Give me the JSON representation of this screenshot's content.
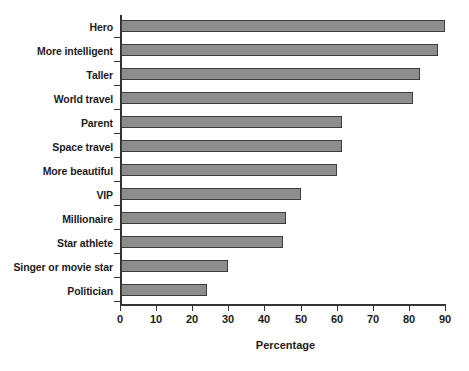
{
  "chart_data": {
    "type": "bar",
    "orientation": "horizontal",
    "title": "",
    "subtitle": "",
    "xlabel": "Percentage",
    "ylabel": "",
    "categories": [
      "Hero",
      "More intelligent",
      "Taller",
      "World travel",
      "Parent",
      "Space travel",
      "More beautiful",
      "VIP",
      "Millionaire",
      "Star athlete",
      "Singer or movie star",
      "Politician"
    ],
    "values": [
      90,
      88,
      83,
      81,
      61.5,
      61.5,
      60,
      50,
      46,
      45,
      30,
      24
    ],
    "xlim": [
      0,
      90
    ],
    "xticks": [
      0,
      10,
      20,
      30,
      40,
      50,
      60,
      70,
      80,
      90
    ],
    "xtick_labels": [
      "0",
      "10",
      "20",
      "30",
      "40",
      "50",
      "60",
      "70",
      "80",
      "90"
    ],
    "grid": false,
    "legend": null,
    "annotations": [],
    "colors": {
      "bar_fill": "#8d8d8d",
      "bar_border": "#3c3c3c",
      "axis": "#333333",
      "text": "#1c1c1c",
      "background": "#ffffff"
    }
  }
}
